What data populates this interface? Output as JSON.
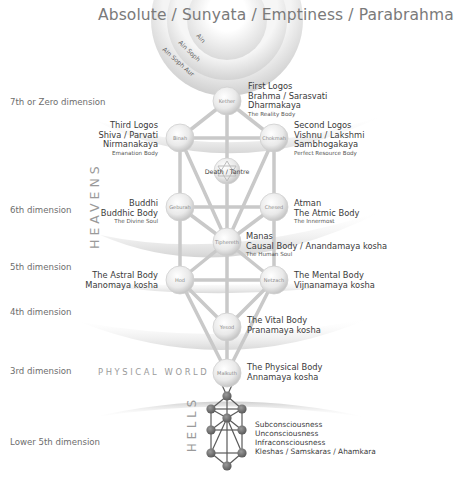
{
  "title": "Absolute / Sunyata / Emptiness / Parabrahma",
  "veils": [
    "Ain",
    "Ain Soph",
    "Ain Soph Aur"
  ],
  "dimensions": [
    "7th or Zero dimension",
    "6th dimension",
    "5th dimension",
    "4th dimension",
    "3rd dimension",
    "Lower 5th dimension"
  ],
  "regions": {
    "heavens": "HEAVENS",
    "physical_world": "PHYSICAL WORLD",
    "hells": "HELLS"
  },
  "sephiroth": [
    {
      "id": "kether",
      "name": "Kether"
    },
    {
      "id": "binah",
      "name": "Binah"
    },
    {
      "id": "chokmah",
      "name": "Chokmah"
    },
    {
      "id": "daath",
      "name": "Death / Tantre"
    },
    {
      "id": "geburah",
      "name": "Geburah"
    },
    {
      "id": "chesed",
      "name": "Chesed"
    },
    {
      "id": "tiphereth",
      "name": "Tiphereth"
    },
    {
      "id": "hod",
      "name": "Hod"
    },
    {
      "id": "netzach",
      "name": "Netzach"
    },
    {
      "id": "yesod",
      "name": "Yesod"
    },
    {
      "id": "malkuth",
      "name": "Malkuth"
    }
  ],
  "labels": {
    "kether": {
      "lines": [
        "First Logos",
        "Brahma / Sarasvati",
        "Dharmakaya"
      ],
      "sub": "The Reality Body"
    },
    "binah": {
      "lines": [
        "Third Logos",
        "Shiva / Parvati",
        "Nirmanakaya"
      ],
      "sub": "Emanation Body"
    },
    "chokmah": {
      "lines": [
        "Second Logos",
        "Vishnu / Lakshmi",
        "Sambhogakaya"
      ],
      "sub": "Perfect Resource Body"
    },
    "geburah": {
      "lines": [
        "Buddhi",
        "Buddhic Body"
      ],
      "sub": "The Divine Soul"
    },
    "chesed": {
      "lines": [
        "Atman",
        "The Atmic Body"
      ],
      "sub": "The Innermost"
    },
    "tiphereth": {
      "lines": [
        "Manas",
        "Causal Body / Anandamaya kosha"
      ],
      "sub": "The Human Soul"
    },
    "hod": {
      "lines": [
        "The Astral Body",
        "Manomaya kosha"
      ]
    },
    "netzach": {
      "lines": [
        "The Mental Body",
        "Vijnanamaya kosha"
      ]
    },
    "yesod": {
      "lines": [
        "The Vital Body",
        "Pranamaya kosha"
      ]
    },
    "malkuth": {
      "lines": [
        "The Physical Body",
        "Annamaya kosha"
      ]
    },
    "hells": {
      "lines": [
        "Subconsciousness",
        "Unconsciousness",
        "Infraconsciousness",
        "Kleshas / Samskaras / Ahamkara"
      ]
    }
  }
}
